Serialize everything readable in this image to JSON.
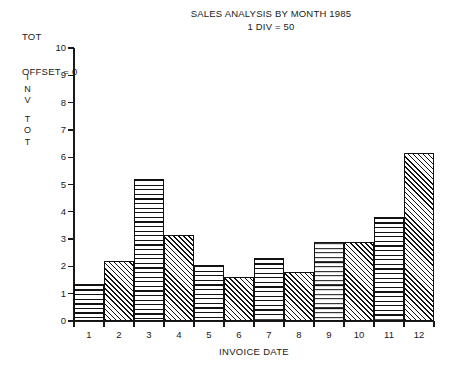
{
  "header": {
    "line1": "TOT",
    "line2": "OFFSET = 0"
  },
  "title": {
    "main": "SALES ANALYSIS BY MONTH 1985",
    "sub": "1 DIV = 50"
  },
  "axes": {
    "y_label_letters": [
      "I",
      "N",
      "V",
      "T",
      "O",
      "T"
    ],
    "x_title": "INVOICE DATE",
    "y_ticks": [
      "10",
      "9",
      "8",
      "7",
      "6",
      "5",
      "4",
      "3",
      "2",
      "1",
      "0"
    ],
    "x_ticks": [
      "1",
      "2",
      "3",
      "4",
      "5",
      "6",
      "7",
      "8",
      "9",
      "10",
      "11",
      "12"
    ]
  },
  "colors": {
    "ink": "#111111",
    "background": "#ffffff"
  },
  "chart_data": {
    "type": "bar",
    "title": "SALES ANALYSIS BY MONTH 1985",
    "subtitle": "1 DIV = 50",
    "xlabel": "INVOICE DATE",
    "ylabel": "INV TOT",
    "ylim": [
      0,
      10
    ],
    "xlim": [
      1,
      12
    ],
    "grid": false,
    "legend": false,
    "categories": [
      "1",
      "2",
      "3",
      "4",
      "5",
      "6",
      "7",
      "8",
      "9",
      "10",
      "11",
      "12"
    ],
    "values": [
      1.35,
      2.2,
      5.2,
      3.15,
      2.05,
      1.6,
      2.3,
      1.8,
      2.9,
      2.9,
      3.8,
      6.15
    ],
    "fills": [
      "horizontal-lines",
      "diagonal-hatch",
      "horizontal-lines",
      "diagonal-hatch",
      "horizontal-lines",
      "diagonal-hatch",
      "horizontal-lines",
      "diagonal-hatch",
      "horizontal-lines",
      "diagonal-hatch",
      "horizontal-lines",
      "diagonal-hatch"
    ]
  }
}
